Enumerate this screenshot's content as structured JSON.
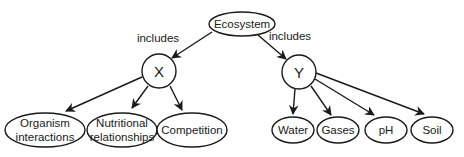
{
  "diagram": {
    "type": "concept-map",
    "colors": {
      "stroke": "#1a1a1a",
      "fill": "#ffffff",
      "text": "#1a1a1a"
    },
    "root": {
      "id": "ecosystem",
      "label": "Ecosystem"
    },
    "edge_labels": {
      "left": "includes",
      "right": "includes"
    },
    "x_node": {
      "id": "x",
      "label": "X",
      "children": [
        {
          "id": "organism-interactions",
          "lines": [
            "Organism",
            "interactions"
          ]
        },
        {
          "id": "nutritional-relationships",
          "lines": [
            "Nutritional",
            "relationships"
          ]
        },
        {
          "id": "competition",
          "lines": [
            "Competition"
          ]
        }
      ]
    },
    "y_node": {
      "id": "y",
      "label": "Y",
      "children": [
        {
          "id": "water",
          "label": "Water"
        },
        {
          "id": "gases",
          "label": "Gases"
        },
        {
          "id": "ph",
          "label": "pH"
        },
        {
          "id": "soil",
          "label": "Soil"
        }
      ]
    }
  }
}
